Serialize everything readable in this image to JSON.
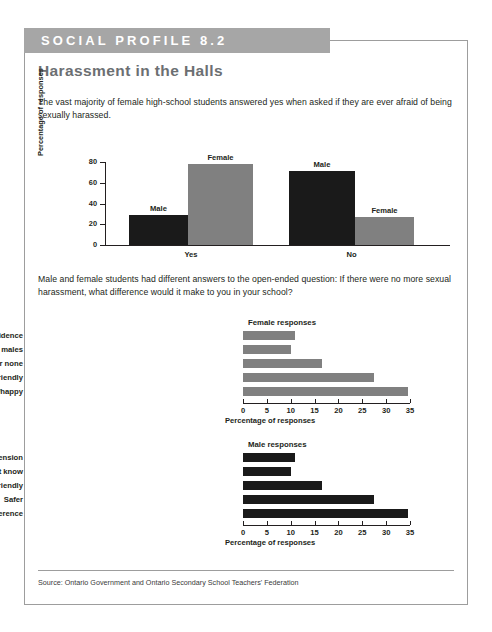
{
  "banner": {
    "label": "SOCIAL PROFILE 8.2"
  },
  "title": "Harassment in the Halls",
  "intro_paragraph": "The vast majority of female high-school students answered yes when asked if they are ever afraid of being sexually harassed.",
  "second_paragraph": "Male and female students had different answers to the open-ended question: If there were no more sexual harassment, what difference would it make to you in your school?",
  "source": "Source: Ontario Government and Ontario Secondary School Teachers' Federation",
  "colors": {
    "banner_gray": "#a6a6a6",
    "bar_gray": "#808080",
    "bar_dark": "#1a1a1a",
    "title_gray": "#6c6f72",
    "border_gray": "#9d9d9d",
    "text": "#231f20"
  },
  "chart_data": [
    {
      "type": "bar",
      "orientation": "vertical",
      "title": "",
      "xlabel": "",
      "ylabel": "Percentage of responses",
      "categories": [
        "Yes",
        "No"
      ],
      "ylim": [
        0,
        80
      ],
      "yticks": [
        0,
        20,
        40,
        60,
        80
      ],
      "grid": false,
      "legend": "none",
      "series": [
        {
          "name": "Male",
          "values": [
            29,
            71
          ],
          "color": "#1a1a1a"
        },
        {
          "name": "Female",
          "values": [
            78,
            27
          ],
          "color": "#808080"
        }
      ],
      "bars": [
        {
          "group": "Yes",
          "series": "Male",
          "value": 29,
          "label": "Male"
        },
        {
          "group": "Yes",
          "series": "Female",
          "value": 78,
          "label": "Female"
        },
        {
          "group": "No",
          "series": "Male",
          "value": 71,
          "label": "Male"
        },
        {
          "group": "No",
          "series": "Female",
          "value": 27,
          "label": "Female"
        }
      ]
    },
    {
      "type": "bar",
      "orientation": "horizontal",
      "title": "Female responses",
      "xlabel": "Percentage of responses",
      "ylabel": "",
      "categories": [
        "More self-confidence",
        "Better comfort level with males",
        "Not much or none",
        "Better school climate, friendly",
        "Less afraid, more comfortable/happy"
      ],
      "values": [
        11,
        10,
        16.5,
        27.5,
        34.5
      ],
      "xlim": [
        0,
        35
      ],
      "xticks": [
        0,
        5,
        10,
        15,
        20,
        25,
        30,
        35
      ],
      "grid": false,
      "color": "#808080"
    },
    {
      "type": "bar",
      "orientation": "horizontal",
      "title": "Male responses",
      "xlabel": "Percentage of responses",
      "ylabel": "",
      "categories": [
        "Happy/less tension",
        "Don't know",
        "Better school climate, friendly",
        "Safer",
        "No difference"
      ],
      "values": [
        11,
        10,
        16.5,
        27.5,
        34.5
      ],
      "xlim": [
        0,
        35
      ],
      "xticks": [
        0,
        5,
        10,
        15,
        20,
        25,
        30,
        35
      ],
      "grid": false,
      "color": "#1a1a1a"
    }
  ]
}
